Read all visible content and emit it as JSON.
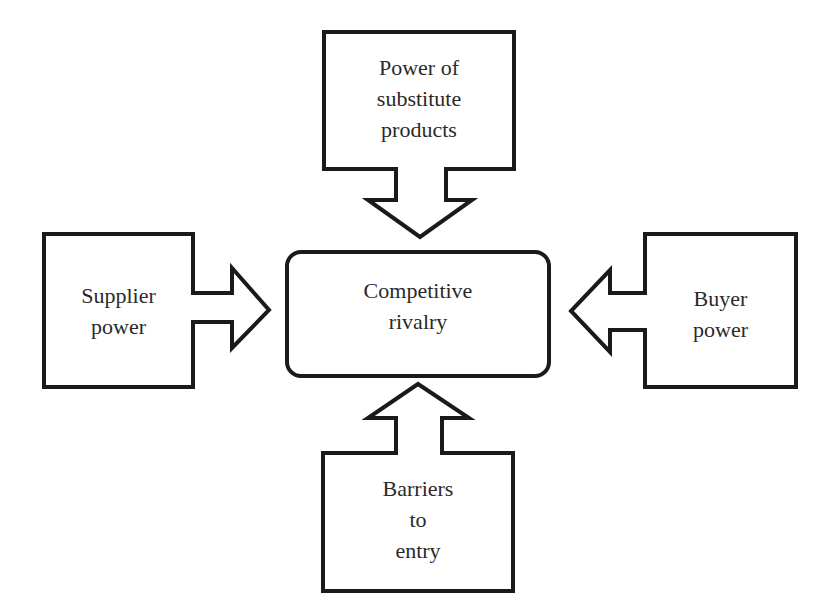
{
  "diagram": {
    "center": {
      "label": "Competitive\nrivalry"
    },
    "forces": [
      {
        "id": "substitutes",
        "label": "Power of\nsubstitute\nproducts",
        "position": "top",
        "arrow_direction": "down"
      },
      {
        "id": "supplier",
        "label": "Supplier\npower",
        "position": "left",
        "arrow_direction": "right"
      },
      {
        "id": "buyer",
        "label": "Buyer\npower",
        "position": "right",
        "arrow_direction": "left"
      },
      {
        "id": "entry",
        "label": "Barriers\nto\nentry",
        "position": "bottom",
        "arrow_direction": "up"
      }
    ],
    "colors": {
      "stroke": "#1a1a1a",
      "fill": "#ffffff",
      "text": "#2a2a2a"
    }
  }
}
